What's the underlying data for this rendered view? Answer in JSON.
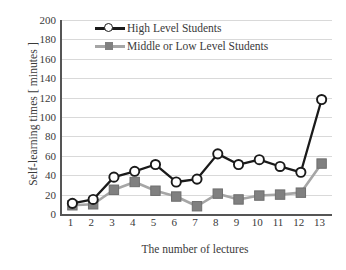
{
  "chart_data": {
    "type": "line",
    "title": "",
    "xlabel": "The number of lectures",
    "ylabel": "Self-learning times [ minutes ]",
    "categories": [
      "1",
      "2",
      "3",
      "4",
      "5",
      "6",
      "7",
      "8",
      "9",
      "10",
      "11",
      "12",
      "13"
    ],
    "x": [
      1,
      2,
      3,
      4,
      5,
      6,
      7,
      8,
      9,
      10,
      11,
      12,
      13
    ],
    "series": [
      {
        "name": "High Level Students",
        "color": "#1a1a1a",
        "marker": "circle-open",
        "values": [
          11,
          15,
          38,
          44,
          51,
          33,
          36,
          62,
          51,
          56,
          49,
          43,
          118
        ]
      },
      {
        "name": "Middle or Low Level Students",
        "color": "#a6a6a6",
        "marker": "square-filled",
        "values": [
          9,
          10,
          25,
          33,
          24,
          18,
          8,
          21,
          15,
          19,
          20,
          22,
          52
        ]
      }
    ],
    "ylim": [
      0,
      200
    ],
    "yticks": [
      0,
      20,
      40,
      60,
      80,
      100,
      120,
      140,
      160,
      180,
      200
    ],
    "ytick_labels": [
      "0",
      "20",
      "40",
      "60",
      "80",
      "100",
      "120",
      "140",
      "160",
      "180",
      "200"
    ],
    "grid": "horizontal",
    "legend_position": "top-left-inside",
    "legend": [
      "High Level Students",
      "Middle or Low Level Students"
    ],
    "axis_color": "#555555",
    "grid_color": "#d9d9d9",
    "background": "#ffffff"
  }
}
